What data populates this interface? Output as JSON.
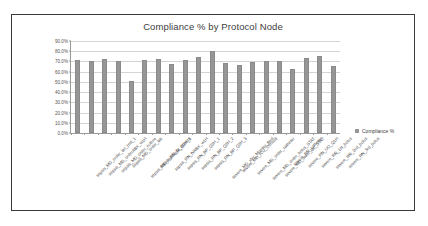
{
  "chart_data": {
    "type": "bar",
    "title": "Compliance % by Protocol Node",
    "xlabel": "",
    "ylabel": "",
    "ylim": [
      0,
      90
    ],
    "ytick_step": 10,
    "grid": true,
    "legend_position": "right",
    "legend": [
      "Compliance %"
    ],
    "series_name": "Compliance %",
    "bar_color": "#969696",
    "categories": [
      "sepsis_MD_order_lac_test_1",
      "sepsis_MD_orderABX_w1H",
      "sepsis_MD_order_culture",
      "sepsis_MD_order_lab",
      "sepsis_MD_reassess_Q2H_1",
      "sepsis_RN_IV_access",
      "sepsis_RN_IVABX_w1H",
      "sepsis_RN_BP_Q2H_1",
      "sepsis_RN_BP_Q2H_2",
      "sepsis_RN_BP_Q2H_3",
      "severe_MD_xfer_Monitor_Bed",
      "severe_MD_ICU_Consult",
      "severe_MD_order_catheter",
      "severe_MD_order_bolus_STAT",
      "severe_MD_order_lac_STAT",
      "severe_RN_catheter",
      "severe_RN_UO_Q1H",
      "severe_RN_1st_bolus",
      "severe_RN_2nd_bolus",
      "severe_RN_3rd_bolus"
    ],
    "values": [
      71.5,
      70.0,
      72.0,
      70.5,
      50.5,
      71.8,
      72.0,
      68.0,
      71.0,
      74.0,
      80.5,
      68.5,
      66.5,
      69.5,
      70.5,
      70.5,
      62.5,
      73.5,
      75.5,
      66.0
    ],
    "ytick_labels": [
      "0.0%",
      "10.0%",
      "20.0%",
      "30.0%",
      "40.0%",
      "50.0%",
      "60.0%",
      "70.0%",
      "80.0%",
      "90.0%"
    ]
  }
}
